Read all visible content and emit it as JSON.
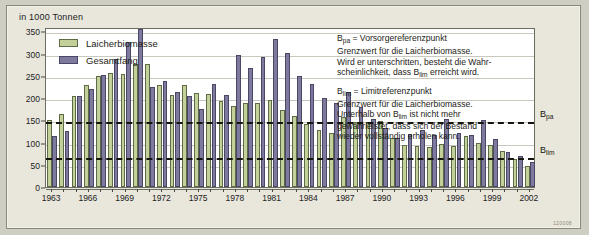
{
  "figure": {
    "unit_title": "in 1000 Tonnen",
    "figure_code": "120008"
  },
  "legend": {
    "items": [
      {
        "label": "Laicherbiomasse",
        "color": "#c3d09a",
        "key": "spawning_biomass"
      },
      {
        "label": "Gesamtfang",
        "color": "#7d7a9e",
        "key": "total_catch"
      }
    ]
  },
  "annotation": {
    "bpa_heading": "B",
    "bpa_sub": "pa",
    "bpa_heading_rest": " = Vorsorgereferenzpunkt",
    "bpa_body_1": "Grenzwert für die Laicherbiomasse.",
    "bpa_body_2": "Wird er unterschritten, besteht die Wahr-",
    "bpa_body_3a": "scheinlichkeit, dass B",
    "bpa_body_3sub": "lim",
    "bpa_body_3b": " erreicht wird.",
    "blim_heading": "B",
    "blim_sub": "lim",
    "blim_heading_rest": " = Limitreferenzpunkt",
    "blim_body_1": "Grenzwert für die Laicherbiomasse.",
    "blim_body_2a": "Unterhalb von B",
    "blim_body_2sub": "lim",
    "blim_body_2b": " ist nicht mehr",
    "blim_body_3": "gewährleistet, dass sich der Bestand",
    "blim_body_4": "wieder vollständig erholen kann."
  },
  "reference_lines": {
    "bpa": {
      "label_main": "B",
      "label_sub": "pa",
      "value": 150
    },
    "blim": {
      "label_main": "B",
      "label_sub": "lim",
      "value": 70
    }
  },
  "chart_data": {
    "type": "bar",
    "title": "in 1000 Tonnen",
    "xlabel": "",
    "ylabel": "in 1000 Tonnen",
    "ylim": [
      0,
      360
    ],
    "yticks": [
      0,
      50,
      100,
      150,
      200,
      250,
      300,
      350
    ],
    "grid": true,
    "legend_position": "top-left",
    "x_tick_labels": [
      "1963",
      "1966",
      "1969",
      "1972",
      "1975",
      "1978",
      "1981",
      "1984",
      "1987",
      "1990",
      "1993",
      "1996",
      "1999",
      "2002"
    ],
    "x_tick_step": 3,
    "categories": [
      "1963",
      "1964",
      "1965",
      "1966",
      "1967",
      "1968",
      "1969",
      "1970",
      "1971",
      "1972",
      "1973",
      "1974",
      "1975",
      "1976",
      "1977",
      "1978",
      "1979",
      "1980",
      "1981",
      "1982",
      "1983",
      "1984",
      "1985",
      "1986",
      "1987",
      "1988",
      "1989",
      "1990",
      "1991",
      "1992",
      "1993",
      "1994",
      "1995",
      "1996",
      "1997",
      "1998",
      "1999",
      "2000",
      "2001",
      "2002"
    ],
    "series": [
      {
        "name": "Laicherbiomasse",
        "color": "#c3d09a",
        "values": [
          151,
          165,
          205,
          230,
          250,
          256,
          255,
          277,
          276,
          229,
          208,
          229,
          211,
          210,
          193,
          183,
          190,
          189,
          196,
          173,
          160,
          142,
          128,
          122,
          158,
          146,
          146,
          148,
          110,
          95,
          93,
          91,
          97,
          92,
          115,
          98,
          95,
          80,
          62,
          48
        ]
      },
      {
        "name": "Gesamtfang",
        "color": "#7d7a9e",
        "values": [
          115,
          126,
          205,
          221,
          252,
          287,
          327,
          355,
          224,
          239,
          213,
          204,
          176,
          232,
          207,
          297,
          268,
          292,
          334,
          301,
          250,
          232,
          200,
          188,
          214,
          180,
          152,
          132,
          110,
          120,
          128,
          116,
          152,
          121,
          118,
          150,
          108,
          78,
          70,
          56
        ]
      }
    ]
  }
}
